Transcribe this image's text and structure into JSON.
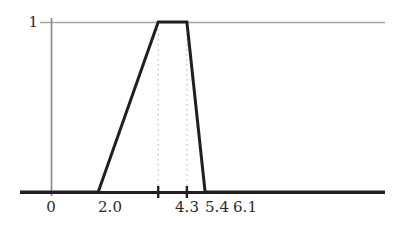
{
  "chart_data": {
    "type": "line",
    "title": "",
    "xlabel": "",
    "ylabel": "",
    "xlim": [
      -1.0,
      13.0
    ],
    "ylim": [
      0,
      1.12
    ],
    "grid": false,
    "legend": null,
    "series": [
      {
        "name": "trapezoidal membership function",
        "x": [
          -1.0,
          2.0,
          4.3,
          5.4,
          6.1,
          13.0
        ],
        "y": [
          0,
          0,
          1,
          1,
          0,
          0
        ],
        "color": "#231f20",
        "linewidth": 3
      }
    ],
    "x_ticks": [
      {
        "value": 0,
        "label": "0"
      },
      {
        "value": 2.0,
        "label": "2.0"
      },
      {
        "value": 4.3,
        "label": "4.3"
      },
      {
        "value": 5.4,
        "label": "5.4"
      },
      {
        "value": 6.1,
        "label": "6.1"
      }
    ],
    "x_tick_marks": [
      4.3,
      5.4
    ],
    "y_ticks": [
      {
        "value": 1,
        "label": "1"
      }
    ],
    "guide_lines": {
      "horizontal": [
        {
          "value": 1,
          "color": "#a6a6a6",
          "style": "solid"
        }
      ],
      "vertical_dotted": [
        {
          "value": 4.3,
          "color": "#bdbdbd",
          "style": "dotted"
        },
        {
          "value": 5.4,
          "color": "#bdbdbd",
          "style": "dotted"
        }
      ]
    },
    "axes": {
      "x_axis_color": "#231f20",
      "y_axis_color": "#8c8c8c"
    }
  },
  "labels": {
    "y1": "1",
    "x0": "0",
    "x2": "2.0",
    "x43": "4.3",
    "x54": "5.4",
    "x61": "6.1"
  }
}
